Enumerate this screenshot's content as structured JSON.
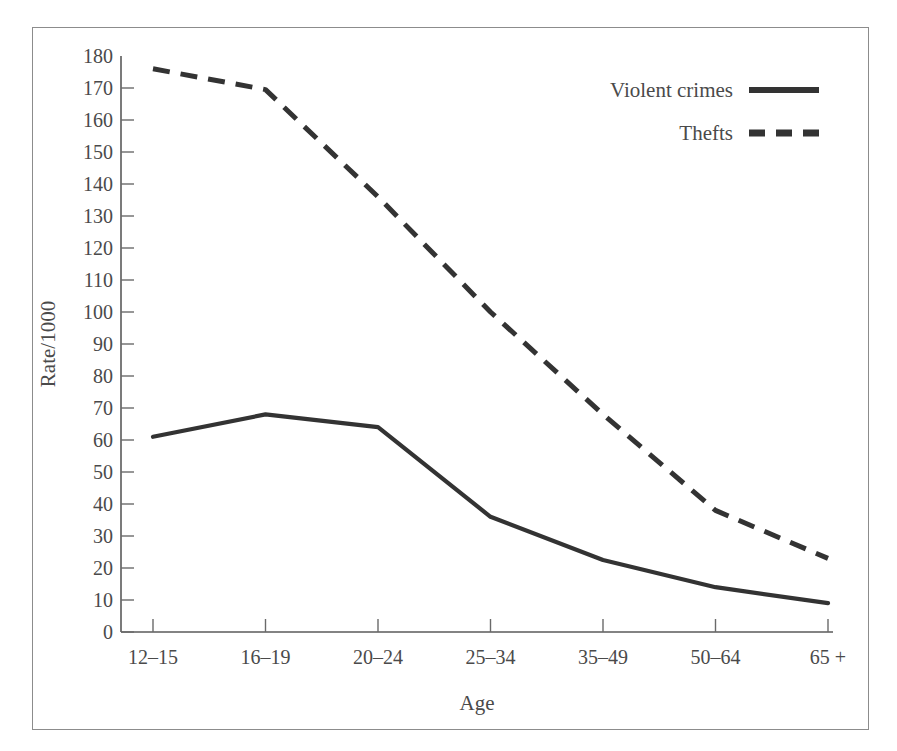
{
  "chart_data": {
    "type": "line",
    "title": "",
    "xlabel": "Age",
    "ylabel": "Rate/1000",
    "categories": [
      "12–15",
      "16–19",
      "20–24",
      "25–34",
      "35–49",
      "50–64",
      "65 +"
    ],
    "ylim": [
      0,
      180
    ],
    "ytick_step": 10,
    "yticks": [
      0,
      10,
      20,
      30,
      40,
      50,
      60,
      70,
      80,
      90,
      100,
      110,
      120,
      130,
      140,
      150,
      160,
      170,
      180
    ],
    "ytick_labels": [
      "0",
      "10",
      "20",
      "30",
      "40",
      "50",
      "60",
      "70",
      "80",
      "90",
      "100",
      "110",
      "120",
      "130",
      "140",
      "150",
      "160",
      "170",
      "180"
    ],
    "grid": false,
    "legend_position": "top-right",
    "series": [
      {
        "name": "Violent crimes",
        "style": "solid",
        "color": "#333333",
        "values": [
          61,
          68,
          64,
          36,
          22.5,
          14,
          9
        ]
      },
      {
        "name": "Thefts",
        "style": "dashed",
        "color": "#333333",
        "values": [
          176,
          169.5,
          136,
          100,
          68,
          38,
          23
        ]
      }
    ]
  },
  "legend": {
    "items": [
      {
        "label": "Violent crimes",
        "style": "solid"
      },
      {
        "label": "Thefts",
        "style": "dashed"
      }
    ]
  }
}
